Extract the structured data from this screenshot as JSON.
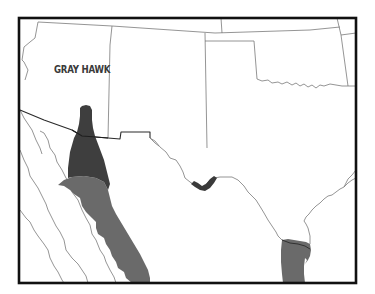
{
  "map": {
    "title": "GRAY HAWK",
    "subject": "Gray Hawk range map",
    "colors": {
      "background": "#ffffff",
      "frame": "#111111",
      "borders": "#777777",
      "international_border": "#222222",
      "range_dark": "#3d3d3d",
      "range_medium": "#6a6a6a"
    },
    "range_areas": [
      {
        "name": "summer-range-arizona-sonora",
        "shade": "dark"
      },
      {
        "name": "year-round-range-west-mexico",
        "shade": "medium"
      },
      {
        "name": "summer-range-big-bend",
        "shade": "dark"
      },
      {
        "name": "year-round-range-south-texas",
        "shade": "medium"
      }
    ],
    "regions_shown": [
      "Arizona",
      "New Mexico",
      "Texas",
      "Oklahoma",
      "Colorado",
      "Utah",
      "Kansas",
      "Sonora",
      "Chihuahua",
      "Baja California",
      "Tamaulipas"
    ]
  }
}
